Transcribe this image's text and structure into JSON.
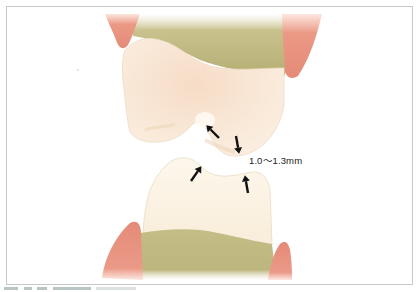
{
  "figure": {
    "measurement_label": "1.0〜1.3mm",
    "caption_visible": "truncated (only top pixels of caption visible, illegible)",
    "colors": {
      "frame_border": "#c8c8c8",
      "gum": "#e8907f",
      "bone": "#bfb984",
      "enamel": "#f8e9d9",
      "enamel_lower": "#fbf3e4",
      "arrow": "#111111",
      "text": "#222222"
    },
    "elements": {
      "upper_tooth": "upper molar crown",
      "lower_tooth": "lower molar crown",
      "arrows": [
        {
          "id": "upper-left-arrow",
          "direction": "down-left"
        },
        {
          "id": "upper-right-arrow",
          "direction": "down"
        },
        {
          "id": "lower-left-arrow",
          "direction": "up-right"
        },
        {
          "id": "lower-right-arrow",
          "direction": "up"
        }
      ]
    }
  }
}
